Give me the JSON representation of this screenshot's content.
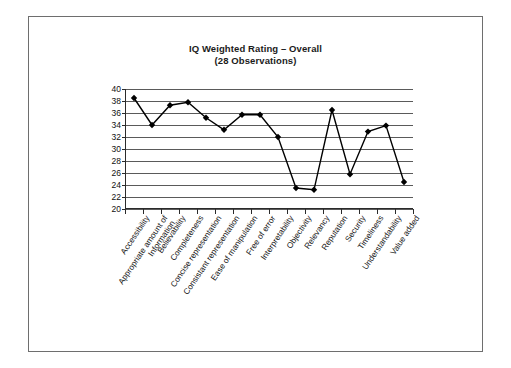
{
  "chart_data": {
    "type": "line",
    "title": "IQ Weighted Rating – Overall",
    "subtitle": "(28 Observations)",
    "xlabel": "",
    "ylabel": "",
    "ylim": [
      20,
      40
    ],
    "ytick_step": 2,
    "yticks": [
      40,
      38,
      36,
      34,
      32,
      30,
      28,
      26,
      24,
      22,
      20
    ],
    "grid": true,
    "legend": "none",
    "marker": "diamond",
    "line_color": "#000000",
    "marker_color": "#000000",
    "categories": [
      "Accessibility",
      "Appropriate amount of Information",
      "Believability",
      "Completeness",
      "Concise representation",
      "Consistant representation",
      "Ease of manipulation",
      "Free of error",
      "Interpretability",
      "Objectivity",
      "Relevancy",
      "Reputation",
      "Security",
      "Timeliness",
      "Understandability",
      "Value added"
    ],
    "values": [
      38.5,
      34.0,
      37.3,
      37.8,
      35.2,
      33.2,
      35.7,
      35.7,
      32.0,
      23.5,
      23.2,
      36.5,
      25.8,
      32.9,
      33.9,
      24.5
    ]
  },
  "axis": {
    "y_labels": [
      "40",
      "38",
      "36",
      "34",
      "32",
      "30",
      "28",
      "26",
      "24",
      "22",
      "20"
    ],
    "x_labels": [
      {
        "l1": "Accessibility",
        "l2": ""
      },
      {
        "l1": "Appropriate amount of",
        "l2": "Information"
      },
      {
        "l1": "Believability",
        "l2": ""
      },
      {
        "l1": "Completeness",
        "l2": ""
      },
      {
        "l1": "Concise representation",
        "l2": ""
      },
      {
        "l1": "Consistant representation",
        "l2": ""
      },
      {
        "l1": "Ease of manipulation",
        "l2": ""
      },
      {
        "l1": "Free of error",
        "l2": ""
      },
      {
        "l1": "Interpretability",
        "l2": ""
      },
      {
        "l1": "Objectivity",
        "l2": ""
      },
      {
        "l1": "Relevancy",
        "l2": ""
      },
      {
        "l1": "Reputation",
        "l2": ""
      },
      {
        "l1": "Security",
        "l2": ""
      },
      {
        "l1": "Timeliness",
        "l2": ""
      },
      {
        "l1": "Understandability",
        "l2": ""
      },
      {
        "l1": "Value added",
        "l2": ""
      }
    ]
  },
  "colors": {
    "frame_border": "#6e6e6e",
    "gridline": "#5a5a5a",
    "axis": "#2b2b2b",
    "text": "#111111",
    "series": "#000000",
    "background": "#ffffff"
  }
}
